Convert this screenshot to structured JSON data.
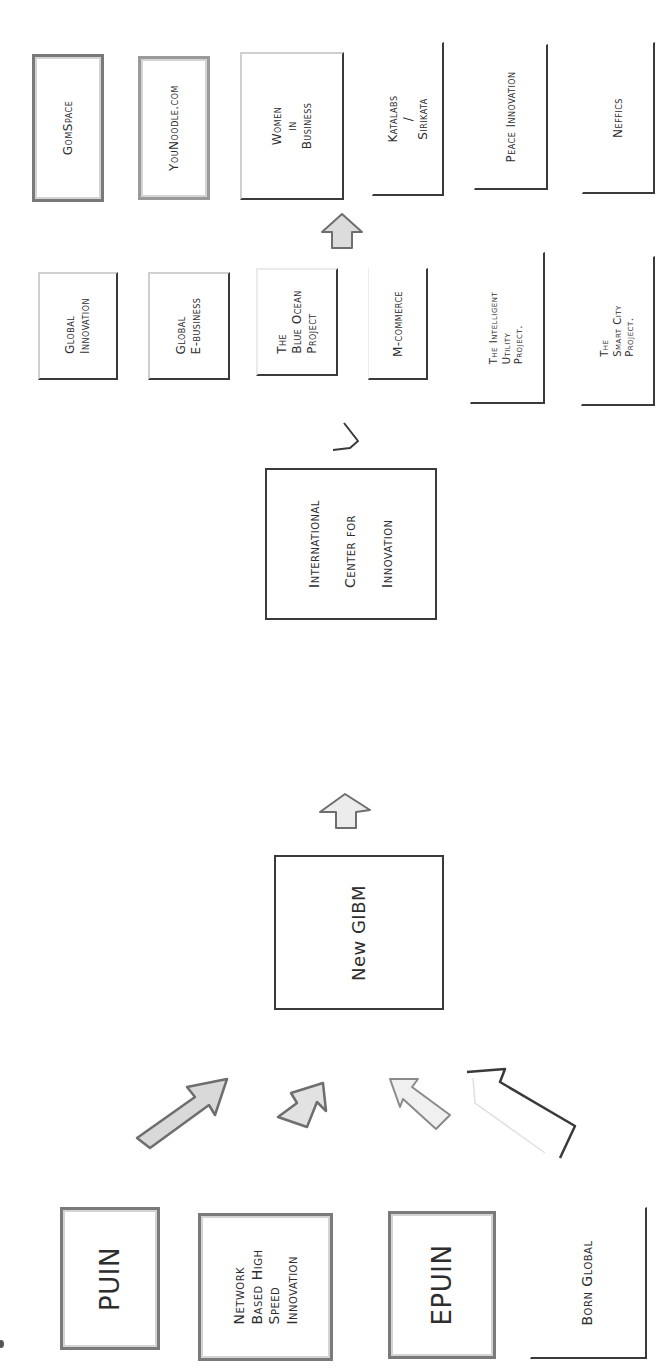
{
  "diagram": {
    "orientation": "rotated 90° counter-clockwise; text reads bottom-to-top",
    "sources": [
      {
        "id": "puin",
        "lines": [
          "PUIN"
        ]
      },
      {
        "id": "network",
        "lines": [
          "Network",
          "Based High",
          "Speed",
          "Innovation"
        ]
      },
      {
        "id": "epuin",
        "lines": [
          "EPUIN"
        ]
      },
      {
        "id": "born-global",
        "lines": [
          "Born Global"
        ]
      }
    ],
    "center": {
      "lines": [
        "New GIBM"
      ]
    },
    "hub": {
      "lines": [
        "International",
        "Center for",
        "Innovation"
      ]
    },
    "projects": [
      {
        "id": "global-innovation",
        "lines": [
          "Global",
          "Innovation"
        ]
      },
      {
        "id": "global-ebusiness",
        "lines": [
          "Global",
          "E-business"
        ]
      },
      {
        "id": "blue-ocean",
        "lines": [
          "The",
          "Blue Ocean",
          "Project"
        ]
      },
      {
        "id": "m-commerce",
        "lines": [
          "M-commerce"
        ]
      },
      {
        "id": "intelligent-utility",
        "lines": [
          "The Intelligent",
          "Utility",
          "Project."
        ]
      },
      {
        "id": "smart-city",
        "lines": [
          "The",
          "Smart City",
          "Project."
        ]
      }
    ],
    "outcomes": [
      {
        "id": "gomspace",
        "lines": [
          "GomSpace"
        ]
      },
      {
        "id": "younoodle",
        "lines": [
          "YouNoodle.com"
        ]
      },
      {
        "id": "women-in-business",
        "lines": [
          "Women",
          "in",
          "Business"
        ]
      },
      {
        "id": "katalabs",
        "lines": [
          "Katalabs",
          "/",
          "Sirikata"
        ]
      },
      {
        "id": "peace-innovation",
        "lines": [
          "Peace Innovation"
        ]
      },
      {
        "id": "neffics",
        "lines": [
          "Neffics"
        ]
      }
    ],
    "colors": {
      "ink": "#2e2e2e",
      "shade": "#7a7a7a",
      "light_shade": "#d4d4d4",
      "paper": "#ffffff"
    }
  }
}
